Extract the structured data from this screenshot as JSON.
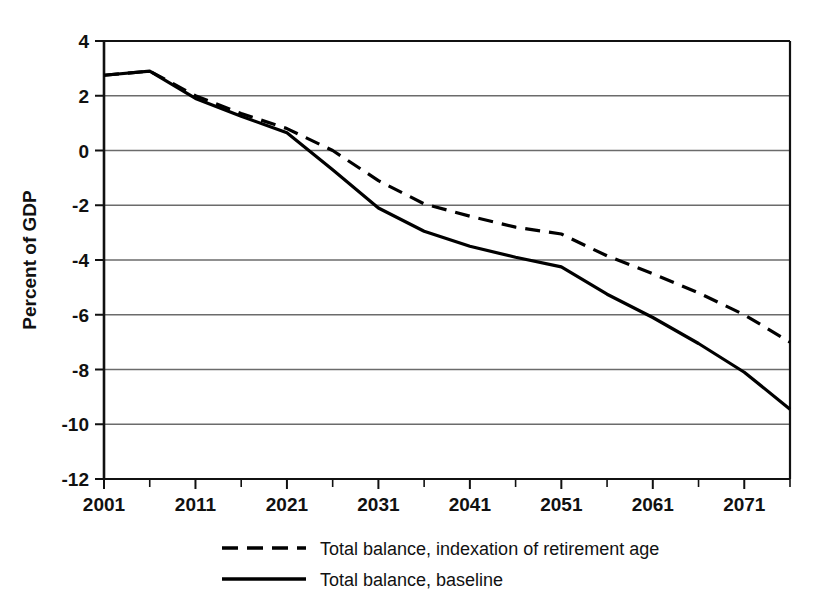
{
  "chart_data": {
    "type": "line",
    "title": "",
    "subtitle": "",
    "xlabel": "",
    "ylabel": "Percent of GDP",
    "xlim": [
      2001,
      2076
    ],
    "ylim": [
      -12,
      4
    ],
    "ytick_step": 2,
    "xtick_step": 10,
    "xtick_minor_step": 5,
    "grid": "horizontal",
    "legend_position": "bottom-center",
    "yticks": [
      "4",
      "2",
      "0",
      "-2",
      "-4",
      "-6",
      "-8",
      "-10",
      "-12"
    ],
    "ytick_values": [
      4,
      2,
      0,
      -2,
      -4,
      -6,
      -8,
      -10,
      -12
    ],
    "xticks": [
      "2001",
      "2011",
      "2021",
      "2031",
      "2041",
      "2051",
      "2061",
      "2071"
    ],
    "xtick_values": [
      2001,
      2011,
      2021,
      2031,
      2041,
      2051,
      2061,
      2071
    ],
    "x": [
      2001,
      2006,
      2011,
      2016,
      2021,
      2026,
      2031,
      2036,
      2041,
      2046,
      2051,
      2056,
      2061,
      2066,
      2071,
      2076
    ],
    "series": [
      {
        "name": "Total balance, indexation of retirement age",
        "style": "dashed",
        "color": "#000000",
        "values": [
          2.75,
          2.9,
          2.0,
          1.35,
          0.8,
          0.0,
          -1.1,
          -1.95,
          -2.4,
          -2.8,
          -3.05,
          -3.85,
          -4.5,
          -5.2,
          -6.0,
          -7.0
        ]
      },
      {
        "name": "Total balance, baseline",
        "style": "solid",
        "color": "#000000",
        "values": [
          2.75,
          2.9,
          1.9,
          1.25,
          0.65,
          -0.7,
          -2.1,
          -2.95,
          -3.5,
          -3.9,
          -4.25,
          -5.25,
          -6.1,
          -7.05,
          -8.1,
          -9.45
        ]
      }
    ],
    "legend": [
      {
        "label": "Total balance, indexation of retirement age",
        "style": "dashed"
      },
      {
        "label": "Total balance, baseline",
        "style": "solid"
      }
    ],
    "colors": {
      "line": "#000000",
      "grid": "#6b6b6b",
      "axis": "#111111",
      "background": "#ffffff"
    }
  }
}
